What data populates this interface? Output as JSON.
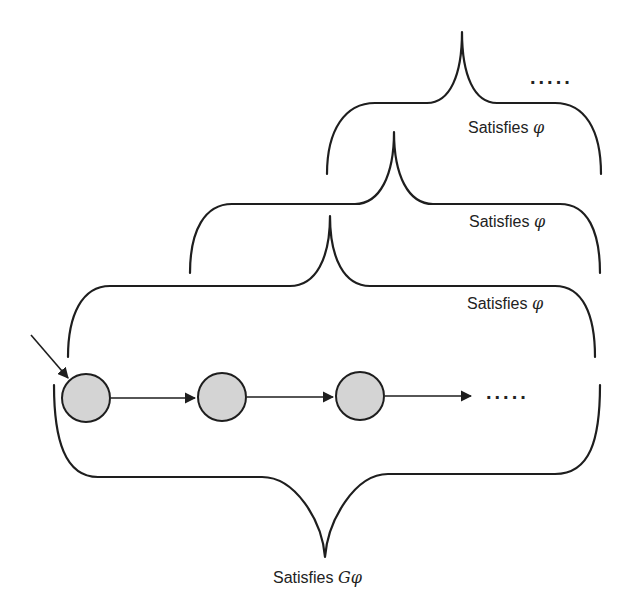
{
  "diagram": {
    "colors": {
      "stroke": "#1e1e1e",
      "state_fill": "#d4d4d4",
      "text": "#222222",
      "background": "#ffffff"
    },
    "states": [
      {
        "id": "s0",
        "initial": true
      },
      {
        "id": "s1",
        "initial": false
      },
      {
        "id": "s2",
        "initial": false
      }
    ],
    "transitions": [
      {
        "from": "s0",
        "to": "s1"
      },
      {
        "from": "s1",
        "to": "s2"
      },
      {
        "from": "s2",
        "to": "continuation"
      }
    ],
    "run_continuation": ".....",
    "braces": [
      {
        "id": "suffix-2",
        "orientation": "up",
        "label_prefix": "Satisfies",
        "label_symbol": "φ"
      },
      {
        "id": "suffix-1",
        "orientation": "up",
        "label_prefix": "Satisfies",
        "label_symbol": "φ"
      },
      {
        "id": "suffix-0",
        "orientation": "up",
        "label_prefix": "Satisfies",
        "label_symbol": "φ"
      },
      {
        "id": "whole-run",
        "orientation": "down",
        "label_prefix": "Satisfies",
        "label_symbol": "Gφ"
      }
    ],
    "top_continuation": "....."
  }
}
